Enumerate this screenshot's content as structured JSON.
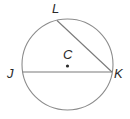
{
  "diagram": {
    "type": "circle-geometry",
    "circle": {
      "name": "C",
      "cx": 67.5,
      "cy": 64.5,
      "r": 45.5,
      "stroke": "#8c8c8c"
    },
    "center": {
      "label": "C",
      "x": 67.5,
      "y": 66,
      "label_x": 63,
      "label_y": 59
    },
    "points": [
      {
        "label": "L",
        "x": 57,
        "y": 20.5,
        "label_x": 52,
        "label_y": 13
      },
      {
        "label": "J",
        "x": 22.5,
        "y": 72,
        "label_x": 7,
        "label_y": 78
      },
      {
        "label": "K",
        "x": 112,
        "y": 72,
        "label_x": 114,
        "label_y": 78
      }
    ],
    "segments": [
      {
        "name": "chord-LK",
        "from": "L",
        "to": "K"
      },
      {
        "name": "chord-JK",
        "from": "J",
        "to": "K"
      }
    ],
    "line_color": "#7a7a7a",
    "text_color": "#2a2a2a"
  }
}
